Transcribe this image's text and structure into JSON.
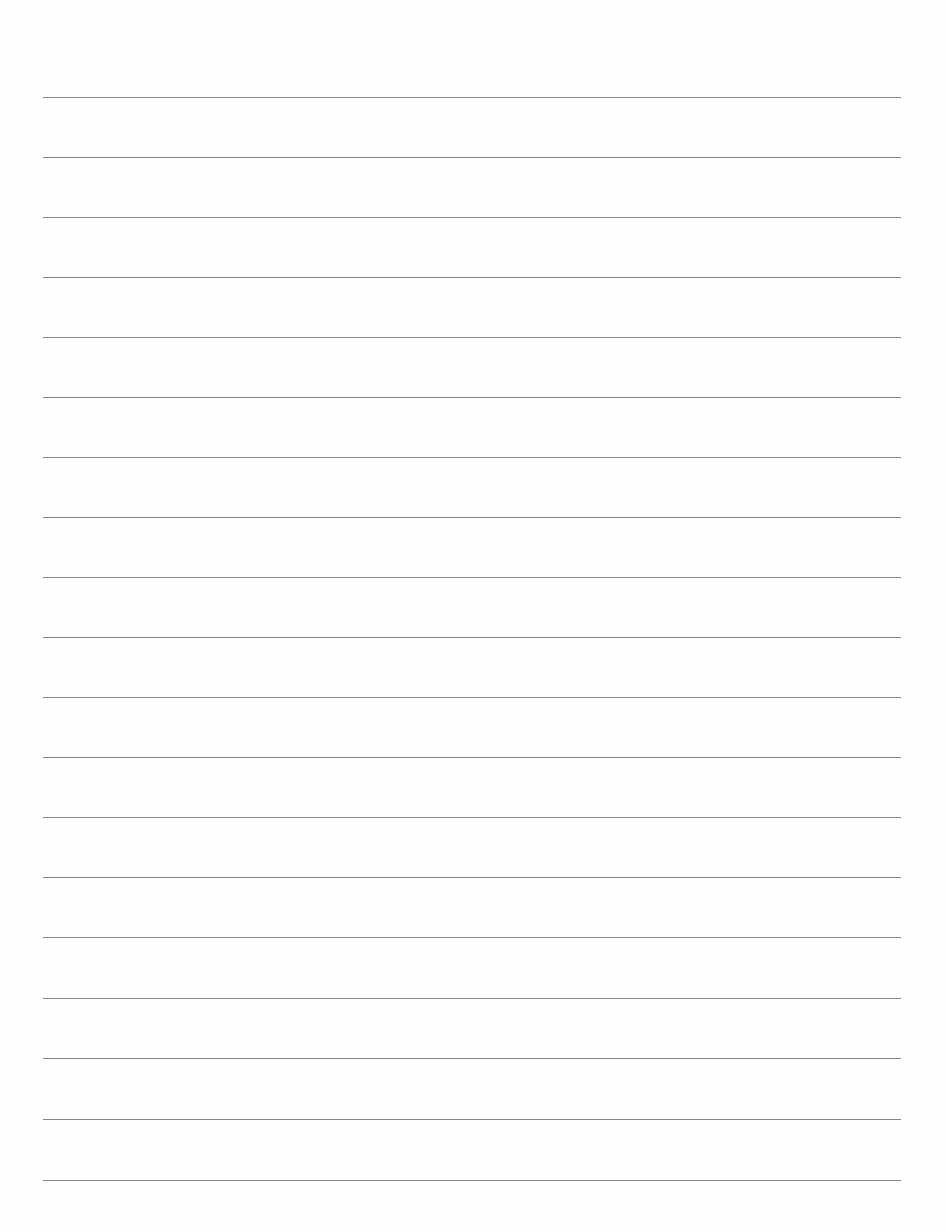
{
  "document": {
    "type": "lined-paper",
    "background_color": "#fefefe",
    "line_color": "#7a7a7a",
    "line_count": 19,
    "line_left_px": 43,
    "line_right_px": 901,
    "line_positions_px": [
      97,
      157,
      217,
      277,
      337,
      397,
      457,
      517,
      577,
      637,
      697,
      757,
      817,
      877,
      937,
      998,
      1058,
      1119,
      1180
    ],
    "text": []
  }
}
